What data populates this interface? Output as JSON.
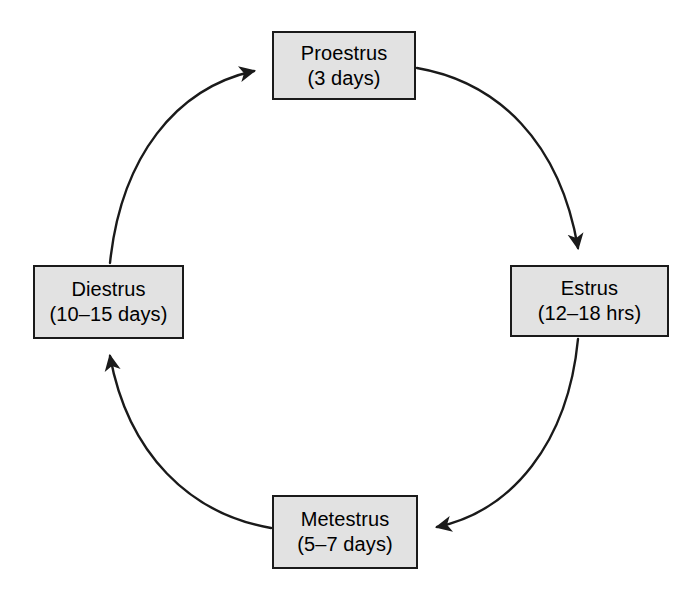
{
  "diagram": {
    "type": "cycle-flowchart",
    "direction": "clockwise",
    "background_color": "#ffffff",
    "node_fill_color": "#e2e2e2",
    "node_border_color": "#1a1a1a",
    "arrow_color": "#1a1a1a",
    "nodes": [
      {
        "id": "proestrus",
        "name": "Proestrus",
        "duration": "(3 days)",
        "position": "top"
      },
      {
        "id": "estrus",
        "name": "Estrus",
        "duration": "(12–18 hrs)",
        "position": "right"
      },
      {
        "id": "metestrus",
        "name": "Metestrus",
        "duration": "(5–7 days)",
        "position": "bottom"
      },
      {
        "id": "diestrus",
        "name": "Diestrus",
        "duration": "(10–15 days)",
        "position": "left"
      }
    ],
    "edges": [
      {
        "id": "proestrus-to-estrus",
        "from": "Proestrus",
        "to": "Estrus",
        "style": "curved-arrow"
      },
      {
        "id": "estrus-to-metestrus",
        "from": "Estrus",
        "to": "Metestrus",
        "style": "curved-arrow"
      },
      {
        "id": "metestrus-to-diestrus",
        "from": "Metestrus",
        "to": "Diestrus",
        "style": "curved-arrow"
      },
      {
        "id": "diestrus-to-proestrus",
        "from": "Diestrus",
        "to": "Proestrus",
        "style": "curved-arrow"
      }
    ]
  }
}
